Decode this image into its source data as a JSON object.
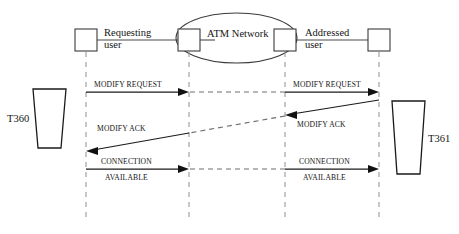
{
  "diagram": {
    "colors": {
      "background": "#ffffff",
      "stroke": "#1a1a1a",
      "lifeline": "#9a9a9a",
      "dashed_message": "#6e6e6e",
      "node_outline": "#3a3a3a"
    },
    "cloud": {
      "label": "ATM Network"
    },
    "nodes": [
      {
        "id": "requesting-user",
        "label_line1": "Requesting",
        "label_line2": "user",
        "x": 86
      },
      {
        "id": "network-ingress",
        "label_line1": "",
        "label_line2": "",
        "x": 189
      },
      {
        "id": "network-egress",
        "label_line1": "",
        "label_line2": "",
        "x": 285
      },
      {
        "id": "addressed-user",
        "label_line1": "Addressed",
        "label_line2": "user",
        "x": 379
      }
    ],
    "endpoints": [
      {
        "id": "left-terminal",
        "label": "T360"
      },
      {
        "id": "right-terminal",
        "label": "T361"
      }
    ],
    "messages": [
      {
        "id": "modify-request-left",
        "label_line1": "MODIFY REQUEST",
        "label_line2": "",
        "direction": "right",
        "style": "solid"
      },
      {
        "id": "modify-request-right",
        "label_line1": "MODIFY REQUEST",
        "label_line2": "",
        "direction": "right",
        "style": "solid"
      },
      {
        "id": "modify-ack-left",
        "label_line1": "MODIFY ACK",
        "label_line2": "",
        "direction": "left",
        "style": "solid"
      },
      {
        "id": "modify-ack-right",
        "label_line1": "MODIFY ACK",
        "label_line2": "",
        "direction": "left",
        "style": "solid"
      },
      {
        "id": "connection-available-left",
        "label_line1": "CONNECTION",
        "label_line2": "AVAILABLE",
        "direction": "right",
        "style": "solid"
      },
      {
        "id": "connection-available-right",
        "label_line1": "CONNECTION",
        "label_line2": "AVAILABLE",
        "direction": "right",
        "style": "solid"
      }
    ]
  }
}
